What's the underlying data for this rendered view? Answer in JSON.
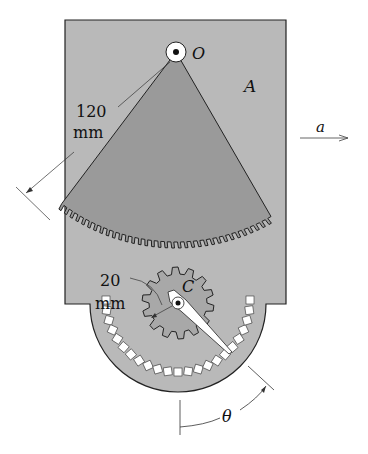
{
  "figure": {
    "body_label": "A",
    "pivot_label": "O",
    "gear_label": "C",
    "acceleration_label": "a",
    "angle_label": "θ",
    "sector_radius_value": "120",
    "sector_radius_unit": "mm",
    "gear_radius_value": "20",
    "gear_radius_unit": "mm",
    "colors": {
      "plate": "#b9b9b9",
      "sector": "#9a9a9a",
      "gear": "#a8a8a8",
      "outline": "#222222",
      "dial_tick": "#ffffff"
    }
  }
}
